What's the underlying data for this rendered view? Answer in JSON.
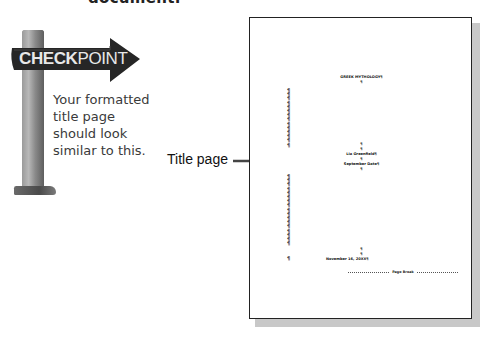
{
  "header": {
    "clipped_text": "document."
  },
  "checkpoint": {
    "sign_label_bold": "CHECK",
    "sign_label_light": "POINT",
    "text_lines": [
      "Your formatted",
      "title page",
      "should look",
      "similar to this."
    ]
  },
  "callout": {
    "label": "Title page",
    "icon": "right-arrow-icon"
  },
  "title_page": {
    "title": "GREEK MYTHOLOGY¶",
    "title_pm": "¶",
    "middle": [
      "¶",
      "¶",
      "Lia Greenfield¶",
      "¶",
      "September Date¶",
      "¶"
    ],
    "bottom": [
      "¶",
      "¶",
      "November 16, 20XX¶"
    ],
    "page_break": "Page Break",
    "left_pm_top": [
      "¶",
      "¶",
      "¶",
      "¶",
      "¶",
      "¶",
      "¶",
      "¶",
      "¶",
      "¶",
      "¶",
      "¶",
      "¶",
      "¶"
    ],
    "left_pm_bottom": [
      "¶",
      "¶",
      "¶",
      "¶",
      "¶",
      "¶",
      "¶",
      "¶",
      "¶",
      "¶",
      "¶",
      "¶",
      "¶",
      "¶",
      "¶",
      "¶",
      "¶"
    ],
    "left_pm_last": "¶"
  },
  "colors": {
    "sign": "#2a2a2a",
    "sign_text": "#e8e8e8",
    "page_border": "#222222",
    "shadow": "#c8c8c8"
  }
}
